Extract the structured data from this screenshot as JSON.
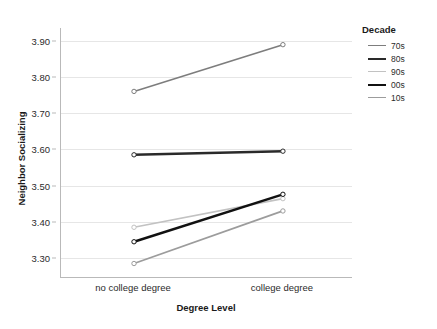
{
  "chart_data": {
    "type": "line",
    "title": "",
    "xlabel": "Degree Level",
    "ylabel": "Neighbor Socializing",
    "categories": [
      "no college degree",
      "college degree"
    ],
    "ylim": [
      3.245,
      3.935
    ],
    "yticks": [
      "3.30",
      "3.40",
      "3.50",
      "3.60",
      "3.70",
      "3.80",
      "3.90"
    ],
    "ytick_values": [
      3.3,
      3.4,
      3.5,
      3.6,
      3.7,
      3.8,
      3.9
    ],
    "grid": true,
    "legend_position": "right",
    "legend_title": "Decade",
    "series": [
      {
        "name": "70s",
        "values": [
          3.76,
          3.889
        ],
        "color": "#7d7d7d",
        "width": 1.6
      },
      {
        "name": "80s",
        "values": [
          3.585,
          3.595
        ],
        "color": "#2a2a2a",
        "width": 2.4
      },
      {
        "name": "90s",
        "values": [
          3.385,
          3.464
        ],
        "color": "#c2c2c2",
        "width": 1.6
      },
      {
        "name": "00s",
        "values": [
          3.345,
          3.476
        ],
        "color": "#111111",
        "width": 2.4
      },
      {
        "name": "10s",
        "values": [
          3.285,
          3.43
        ],
        "color": "#9c9c9c",
        "width": 1.8
      }
    ]
  },
  "axes": {
    "y_title": "Neighbor Socializing",
    "x_title": "Degree Level"
  },
  "legend": {
    "title": "Decade",
    "items": [
      {
        "label": "70s"
      },
      {
        "label": "80s"
      },
      {
        "label": "90s"
      },
      {
        "label": "00s"
      },
      {
        "label": "10s"
      }
    ]
  },
  "colors": {
    "grid": "#e6e6e6",
    "axis": "#b9b9b9",
    "text": "#1a1a1a",
    "background": "#ffffff"
  }
}
